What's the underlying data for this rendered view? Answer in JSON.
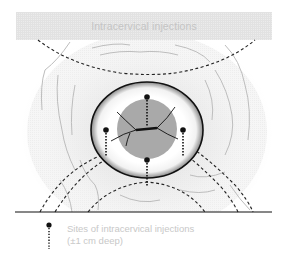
{
  "diagram": {
    "title": "Intracervical injections",
    "legend": {
      "line1": "Sites of intracervical injections",
      "line2": "(±1 cm deep)",
      "symbol": "injection-site-marker"
    },
    "injection_sites": [
      {
        "position": "12 o'clock",
        "x": 147,
        "y": 97
      },
      {
        "position": "3 o'clock",
        "x": 183,
        "y": 130
      },
      {
        "position": "6 o'clock",
        "x": 147,
        "y": 160
      },
      {
        "position": "9 o'clock",
        "x": 106,
        "y": 130
      }
    ],
    "colors": {
      "outline": "#111111",
      "os_fill": "#a9a9a9",
      "title_text": "#c4c4c4",
      "legend_text": "#c8c8c8"
    }
  }
}
